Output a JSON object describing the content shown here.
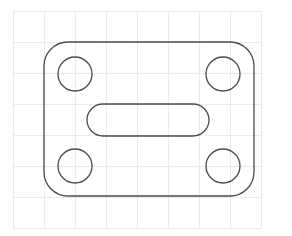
{
  "canvas": {
    "width": 292,
    "height": 236,
    "background_color": "#ffffff",
    "title": "Gasket Plate Outline Sketch"
  },
  "grid": {
    "visible": true,
    "line_color": "#e6ebf2",
    "line_width": 1,
    "cell_size": 31,
    "origin_x": 13,
    "origin_y": 11,
    "vertical_lines": [
      13,
      44,
      75,
      106,
      137,
      168,
      199,
      230,
      261
    ],
    "horizontal_lines": [
      11,
      42,
      73,
      104,
      135,
      166,
      197,
      228
    ]
  },
  "drawing": {
    "stroke_color": "#4a4a52",
    "stroke_width": 1.3,
    "fill": "none",
    "shapes": [
      {
        "name": "outer-plate-outline",
        "type": "rounded-rectangle",
        "x": 44,
        "y": 42,
        "width": 210,
        "height": 154,
        "corner_radius": 24
      },
      {
        "name": "bolt-hole-top-left",
        "type": "circle",
        "cx": 75,
        "cy": 74,
        "r": 17
      },
      {
        "name": "bolt-hole-top-right",
        "type": "circle",
        "cx": 223,
        "cy": 74,
        "r": 17
      },
      {
        "name": "bolt-hole-bottom-left",
        "type": "circle",
        "cx": 75,
        "cy": 166,
        "r": 17
      },
      {
        "name": "bolt-hole-bottom-right",
        "type": "circle",
        "cx": 223,
        "cy": 166,
        "r": 17
      },
      {
        "name": "center-slot",
        "type": "rounded-rectangle",
        "x": 87,
        "y": 104,
        "width": 122,
        "height": 32,
        "corner_radius": 16
      }
    ]
  }
}
